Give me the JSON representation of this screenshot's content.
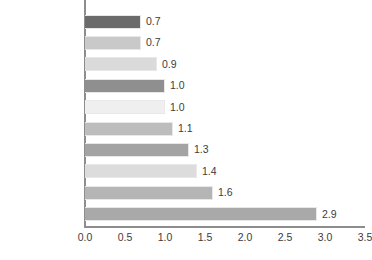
{
  "chart_data": {
    "type": "bar",
    "orientation": "horizontal",
    "title": "",
    "xlabel": "",
    "ylabel": "",
    "xlim": [
      0.0,
      3.5
    ],
    "xticks": [
      "0.0",
      "0.5",
      "1.0",
      "1.5",
      "2.0",
      "2.5",
      "3.0",
      "3.5"
    ],
    "xtick_values": [
      0.0,
      0.5,
      1.0,
      1.5,
      2.0,
      2.5,
      3.0,
      3.5
    ],
    "grid": false,
    "legend": "none",
    "categories": [
      "Italian",
      "French Creole",
      "Russian",
      "Arabic",
      "German",
      "Korean",
      "French",
      "Vietnamese",
      "Tagalog",
      "Chinese"
    ],
    "values": [
      0.7,
      0.7,
      0.9,
      1.0,
      1.0,
      1.1,
      1.3,
      1.4,
      1.6,
      2.9
    ],
    "value_labels": [
      "0.7",
      "0.7",
      "0.9",
      "1.0",
      "1.0",
      "1.1",
      "1.3",
      "1.4",
      "1.6",
      "2.9"
    ],
    "bar_colors": [
      "#6b6b6b",
      "#c9c9c9",
      "#dadada",
      "#8f8f8f",
      "#efefef",
      "#bdbdbd",
      "#a3a3a3",
      "#dcdcdc",
      "#b5b5b5",
      "#a9a9a9"
    ],
    "bar_border_color": "#e8e8e8",
    "axis_color": "#8d8d8d",
    "text_color": "#3c3c3c",
    "background_color": "#ffffff"
  }
}
